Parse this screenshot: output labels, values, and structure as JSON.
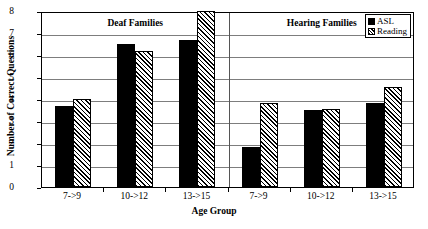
{
  "chart_data": {
    "type": "bar",
    "title": "",
    "xlabel": "Age Group",
    "ylabel": "Number of Correct Questions",
    "ylim": [
      0,
      8
    ],
    "ytick_labels": [
      "0",
      "1",
      "2",
      "3",
      "4",
      "5",
      "6",
      "7",
      "8"
    ],
    "grid": true,
    "legend_position": "top-right",
    "categories": [
      "7->9",
      "10->12",
      "13->15",
      "7->9",
      "10->12",
      "13->15"
    ],
    "group_labels": [
      "Deaf Families",
      "Hearing Families"
    ],
    "series": [
      {
        "name": "ASL",
        "values": [
          3.7,
          6.5,
          6.7,
          1.8,
          3.5,
          3.8
        ]
      },
      {
        "name": "Reading",
        "values": [
          4.0,
          6.2,
          8.0,
          3.8,
          3.55,
          4.55
        ]
      }
    ],
    "colors": {
      "asl": "#000000",
      "reading_fill": "#ffffff",
      "reading_hatch": "#000000",
      "gridline": "#7d7d7d",
      "axis": "#000000",
      "background": "#ffffff"
    }
  },
  "legend": {
    "items": [
      {
        "label": "ASL",
        "swatch": "solid-black-square-icon"
      },
      {
        "label": "Reading",
        "swatch": "hatched-square-icon"
      }
    ]
  },
  "axes": {
    "y_title": "Number of Correct Questions",
    "x_title": "Age Group"
  }
}
